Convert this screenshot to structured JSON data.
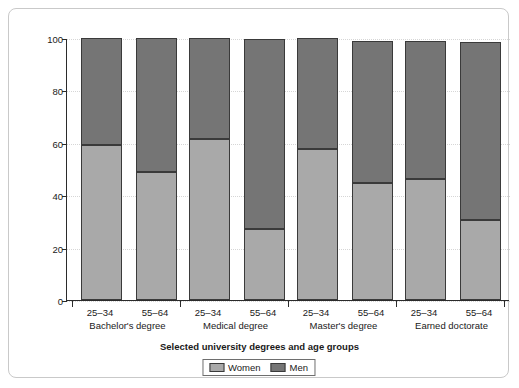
{
  "chart_data": {
    "type": "bar",
    "subtype": "stacked-percentage",
    "title": "",
    "xlabel": "Selected university degrees and age groups",
    "ylabel": "Percentage",
    "ylim": [
      0,
      100
    ],
    "yticks": [
      0,
      20,
      40,
      60,
      80,
      100
    ],
    "ytick_labels": [
      "0",
      "20",
      "40",
      "60",
      "80",
      "100"
    ],
    "grid": "horizontal-dotted",
    "legend_position": "bottom-center",
    "categories": [
      "25–34",
      "55–64",
      "25–34",
      "55–64",
      "25–34",
      "55–64",
      "25–34",
      "55–64"
    ],
    "groups": [
      {
        "label": "Bachelor's degree",
        "categories": [
          "25–34",
          "55–64"
        ]
      },
      {
        "label": "Medical degree",
        "categories": [
          "25–34",
          "55–64"
        ]
      },
      {
        "label": "Master's degree",
        "categories": [
          "25–34",
          "55–64"
        ]
      },
      {
        "label": "Earned doctorate",
        "categories": [
          "25–34",
          "55–64"
        ]
      }
    ],
    "series": [
      {
        "name": "Women",
        "color": "#a9a9a9",
        "values": [
          59,
          49,
          61.5,
          27,
          57.5,
          44.5,
          46,
          30.5
        ]
      },
      {
        "name": "Men",
        "color": "#757575",
        "values": [
          41,
          51,
          38.5,
          73,
          42.5,
          54.5,
          53,
          68.5
        ]
      }
    ],
    "bar_totals": [
      100,
      100,
      100,
      99.5,
      100,
      99,
      99,
      98.5
    ]
  },
  "legend": {
    "items": [
      {
        "label": "Women",
        "swatch_name": "legend-swatch-women"
      },
      {
        "label": "Men",
        "swatch_name": "legend-swatch-men"
      }
    ]
  },
  "colors": {
    "women": "#a9a9a9",
    "men": "#757575",
    "axis": "#2b2b2b",
    "grid": "#d6d6d6",
    "border": "#c9c9c9",
    "background": "#ffffff"
  }
}
